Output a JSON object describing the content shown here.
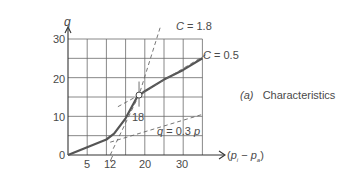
{
  "chart_data": {
    "type": "line",
    "caption_tag": "(a)",
    "caption_text": "Characteristics",
    "xlabel": "(p_i − p_a)",
    "ylabel": "q",
    "xlim": [
      0,
      35
    ],
    "ylim": [
      0,
      30
    ],
    "grid": true,
    "x_ticks": [
      5,
      12,
      20,
      30
    ],
    "y_ticks": [
      0,
      10,
      20,
      30
    ],
    "series": [
      {
        "name": "characteristic",
        "style": "solid",
        "x": [
          0,
          5,
          10,
          12,
          15,
          18,
          20,
          25,
          30,
          35
        ],
        "y": [
          0,
          2,
          4,
          5.5,
          9.5,
          15,
          16.5,
          19.5,
          22,
          25
        ]
      },
      {
        "name": "C = 1.8",
        "style": "dashed",
        "x": [
          11,
          18.5,
          24
        ],
        "y": [
          0,
          15.5,
          33
        ]
      },
      {
        "name": "C = 0.5",
        "style": "dashed",
        "x": [
          13,
          18.5,
          36
        ],
        "y": [
          12.5,
          15.5,
          26
        ]
      },
      {
        "name": "q = 0.3 p",
        "style": "dashed",
        "x": [
          11,
          35
        ],
        "y": [
          3.3,
          10.5
        ]
      }
    ],
    "annotations": [
      {
        "text": "C = 1.8",
        "x": 24,
        "y": 32
      },
      {
        "text": "C = 0.5",
        "x": 36,
        "y": 26
      },
      {
        "text": "q = 0.3 p",
        "x": 24,
        "y": 7
      },
      {
        "text": "18",
        "x": 18.5,
        "y": 10
      },
      {
        "text": "operating point",
        "x": 18.5,
        "y": 15.5,
        "marker": "open-circle"
      }
    ]
  },
  "labels": {
    "y_axis": "q",
    "x_axis_open": "(",
    "x_axis_p1": "p",
    "x_axis_sub1": "i",
    "x_axis_minus": " − ",
    "x_axis_p2": "p",
    "x_axis_sub2": "a",
    "x_axis_close": ")",
    "y30": "30",
    "y20": "20",
    "y10": "10",
    "y0": "0",
    "x5": "5",
    "x12": "12",
    "x20": "20",
    "x30": "30",
    "c18": "C = 1.8",
    "c05": "C = 0.5",
    "q03": "q = 0.3 p",
    "pt18": "18",
    "caption_tag": "(a)",
    "caption_text": "Characteristics"
  }
}
